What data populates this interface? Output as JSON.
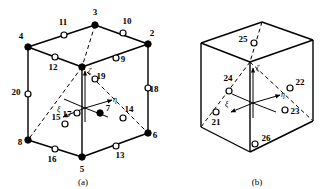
{
  "figure": {
    "panels": [
      {
        "id": "a",
        "caption": "(a)"
      },
      {
        "id": "b",
        "caption": "(b)"
      }
    ],
    "axis_labels": {
      "zeta": "ζ",
      "eta": "η",
      "xi": "ξ"
    },
    "colors": {
      "line": "#000000",
      "fill_solid": "#000000",
      "fill_open": "#ffffff",
      "background": "#ffffff"
    }
  },
  "panel_a": {
    "caption": "(a)",
    "corner_nodes": [
      {
        "id": "1",
        "label": "",
        "x": 82,
        "y": 67,
        "type": "solid",
        "lx": 0,
        "ly": 0
      },
      {
        "id": "2",
        "label": "2",
        "x": 148,
        "y": 44,
        "type": "solid",
        "lx": 152,
        "ly": 36
      },
      {
        "id": "3",
        "label": "3",
        "x": 95,
        "y": 25,
        "type": "solid",
        "lx": 95,
        "ly": 15
      },
      {
        "id": "4",
        "label": "4",
        "x": 28,
        "y": 47,
        "type": "solid",
        "lx": 21,
        "ly": 39
      },
      {
        "id": "5",
        "label": "5",
        "x": 82,
        "y": 157,
        "type": "solid",
        "lx": 82,
        "ly": 172
      },
      {
        "id": "6",
        "label": "6",
        "x": 148,
        "y": 133,
        "type": "solid",
        "lx": 155,
        "ly": 138
      },
      {
        "id": "7",
        "label": "7",
        "x": 100,
        "y": 113,
        "type": "solid",
        "lx": 108,
        "ly": 111
      },
      {
        "id": "8",
        "label": "8",
        "x": 28,
        "y": 140,
        "type": "solid",
        "lx": 20,
        "ly": 145
      }
    ],
    "mid_nodes": [
      {
        "id": "9",
        "label": "9",
        "x": 116,
        "y": 58,
        "type": "open",
        "lx": 123,
        "ly": 62
      },
      {
        "id": "10",
        "label": "10",
        "x": 123,
        "y": 33,
        "type": "open",
        "lx": 127,
        "ly": 24
      },
      {
        "id": "11",
        "label": "11",
        "x": 64,
        "y": 35,
        "type": "open",
        "lx": 63,
        "ly": 25
      },
      {
        "id": "12",
        "label": "12",
        "x": 55,
        "y": 57,
        "type": "open",
        "lx": 53,
        "ly": 70
      },
      {
        "id": "13",
        "label": "13",
        "x": 116,
        "y": 146,
        "type": "open",
        "lx": 120,
        "ly": 158
      },
      {
        "id": "14",
        "label": "14",
        "x": 123,
        "y": 118,
        "type": "open",
        "lx": 129,
        "ly": 112
      },
      {
        "id": "15",
        "label": "15",
        "x": 65,
        "y": 124,
        "type": "open",
        "lx": 56,
        "ly": 120
      },
      {
        "id": "16",
        "label": "16",
        "x": 55,
        "y": 149,
        "type": "open",
        "lx": 52,
        "ly": 162
      },
      {
        "id": "17",
        "label": "17",
        "x": 77,
        "y": 113,
        "type": "open",
        "lx": 67,
        "ly": 117
      },
      {
        "id": "18",
        "label": "18",
        "x": 148,
        "y": 88,
        "type": "open",
        "lx": 154,
        "ly": 92
      },
      {
        "id": "19",
        "label": "19",
        "x": 95,
        "y": 79,
        "type": "open",
        "lx": 101,
        "ly": 79
      },
      {
        "id": "20",
        "label": "20",
        "x": 28,
        "y": 94,
        "type": "open",
        "lx": 16,
        "ly": 95
      }
    ]
  },
  "panel_b": {
    "caption": "(b)",
    "face_nodes": [
      {
        "id": "21",
        "label": "21",
        "x": 216,
        "y": 112,
        "type": "open",
        "lx": 216,
        "ly": 125
      },
      {
        "id": "22",
        "label": "22",
        "x": 290,
        "y": 88,
        "type": "open",
        "lx": 300,
        "ly": 85
      },
      {
        "id": "23",
        "label": "23",
        "x": 285,
        "y": 110,
        "type": "open",
        "lx": 295,
        "ly": 114
      },
      {
        "id": "24",
        "label": "24",
        "x": 229,
        "y": 91,
        "type": "open",
        "lx": 228,
        "ly": 81
      },
      {
        "id": "25",
        "label": "25",
        "x": 254,
        "y": 43,
        "type": "open",
        "lx": 243,
        "ly": 42
      },
      {
        "id": "26",
        "label": "26",
        "x": 255,
        "y": 144,
        "type": "open",
        "lx": 266,
        "ly": 141
      }
    ]
  }
}
